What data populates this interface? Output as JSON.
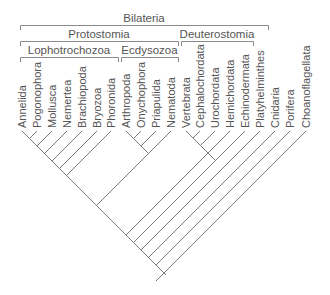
{
  "diagram": {
    "type": "phylogenetic-tree",
    "clades": [
      {
        "name": "Bilateria",
        "x1": 20,
        "x2": 268,
        "y": 25
      },
      {
        "name": "Protostomia",
        "x1": 20,
        "x2": 178,
        "y": 41
      },
      {
        "name": "Deuterostomia",
        "x1": 181,
        "x2": 253,
        "y": 41
      },
      {
        "name": "Lophotrochozoa",
        "x1": 20,
        "x2": 118,
        "y": 57
      },
      {
        "name": "Ecdysozoa",
        "x1": 121,
        "x2": 178,
        "y": 57
      }
    ],
    "taxa": [
      "Annelida",
      "Pogonophora",
      "Mollusca",
      "Nemertea",
      "Brachiopoda",
      "Bryozoa",
      "Phoronida",
      "Arthropoda",
      "Onychophora",
      "Priapulida",
      "Nematoda",
      "Vertebrata",
      "Cephalochordata",
      "Urochordata",
      "Hemichordata",
      "Echinodermata",
      "Platyhelminthes",
      "Cnidaria",
      "Porifera",
      "Choanoflagellata"
    ],
    "colors": {
      "line": "#7a7a7a",
      "text": "#555555"
    }
  }
}
